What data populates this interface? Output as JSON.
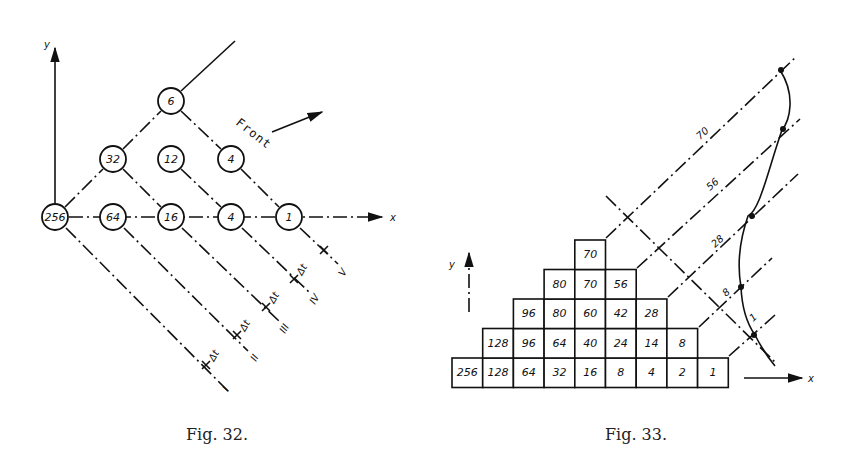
{
  "fig32": {
    "caption": "Fig. 32.",
    "axis_x_label": "x",
    "axis_y_label": "y",
    "front_label": "Front",
    "delta_label": "Δt",
    "nodes": [
      {
        "value": "256",
        "cx": 55,
        "cy": 217
      },
      {
        "value": "64",
        "cx": 113,
        "cy": 217
      },
      {
        "value": "16",
        "cx": 171,
        "cy": 217
      },
      {
        "value": "4",
        "cx": 231,
        "cy": 217
      },
      {
        "value": "1",
        "cx": 289,
        "cy": 217
      },
      {
        "value": "32",
        "cx": 113,
        "cy": 159
      },
      {
        "value": "12",
        "cx": 171,
        "cy": 159
      },
      {
        "value": "4",
        "cx": 231,
        "cy": 159
      },
      {
        "value": "6",
        "cx": 171,
        "cy": 101
      }
    ],
    "lines": [
      "I",
      "II",
      "III",
      "IV",
      "V"
    ]
  },
  "fig33": {
    "caption": "Fig. 33.",
    "axis_x_label": "x",
    "axis_y_label": "y",
    "rows": [
      [
        "256",
        "128",
        "64",
        "32",
        "16",
        "8",
        "4",
        "2",
        "1"
      ],
      [
        "128",
        "96",
        "64",
        "40",
        "24",
        "14",
        "8"
      ],
      [
        "96",
        "80",
        "60",
        "42",
        "28"
      ],
      [
        "80",
        "70",
        "56"
      ],
      [
        "70"
      ]
    ],
    "diagonal_labels": [
      "70",
      "56",
      "28",
      "8",
      "1"
    ]
  }
}
